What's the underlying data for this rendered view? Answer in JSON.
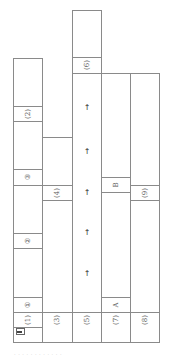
{
  "diagram": {
    "orientation": "rotated-90-ccw",
    "line_color": "#8a8a8a",
    "columns": [
      {
        "id": "col1",
        "row_label": "(1)",
        "segments": [
          {
            "label": "①"
          },
          {
            "label": "②"
          },
          {
            "label": "③"
          },
          {
            "label": "(2)"
          }
        ]
      },
      {
        "id": "col2",
        "row_label": "(3)",
        "segments": [
          {
            "label": "(4)"
          }
        ]
      },
      {
        "id": "col3",
        "row_label": "(5)",
        "segments": [
          {
            "label": "(6)"
          }
        ],
        "arrows": [
          "→",
          "→",
          "→",
          "→",
          "→"
        ]
      },
      {
        "id": "col4",
        "row_label": "(7)",
        "segments": [
          {
            "label": "A"
          },
          {
            "label": "B"
          }
        ]
      },
      {
        "id": "col5",
        "row_label": "(8)",
        "segments": [
          {
            "label": "(9)"
          }
        ]
      }
    ],
    "figure_marker": "1",
    "caption": "· · ·   · · ·   · · · · · ·"
  }
}
